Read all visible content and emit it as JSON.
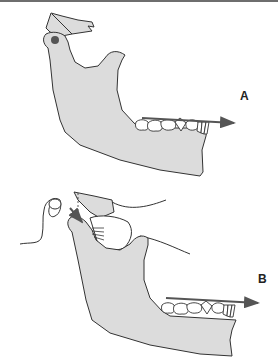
{
  "figure": {
    "panels": [
      {
        "id": "A",
        "label": "A",
        "description": "Mandible with condyle, coronoid process and teeth; arrow showing forward direction along teeth"
      },
      {
        "id": "B",
        "label": "B",
        "description": "Mandible with condyle displaced, articular disc and soft tissue; arrows showing forward and downward movement"
      }
    ]
  },
  "colors": {
    "bone": "#dcdcdc",
    "outline": "#333333",
    "arrow": "#555555",
    "condyle_dot": "#555555",
    "tooth": "#ffffff"
  }
}
